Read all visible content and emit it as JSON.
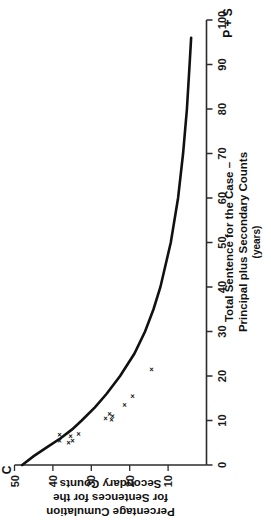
{
  "figure": {
    "corner_label": "C",
    "top_right_label": "P + S"
  },
  "chart_data": {
    "type": "scatter",
    "title": "",
    "subtitle": "",
    "xlabel": "Total Sentence for the Case – Principal plus Secondary Counts",
    "xlabel_line1": "Total Sentence for the Case –",
    "xlabel_line2": "Principal plus Secondary Counts",
    "xlabel_units": "(years)",
    "ylabel": "Percentage Cumulation for Sentences for the Secondary Counts",
    "ylabel_line1": "Percentage Cumulation",
    "ylabel_line2": "for Sentences for the",
    "ylabel_line3": "Secondary Counts",
    "x_axis_symbol": "P + S",
    "y_axis_symbol": "C",
    "xlim": [
      0,
      100
    ],
    "ylim": [
      0,
      50
    ],
    "xticks": [
      0,
      10,
      20,
      30,
      40,
      50,
      60,
      70,
      80,
      90,
      100
    ],
    "xticklabels": [
      "0",
      "10",
      "20",
      "30",
      "40",
      "50",
      "60",
      "70",
      "80",
      "90",
      "100"
    ],
    "yticks": [
      10,
      20,
      30,
      40,
      50
    ],
    "yticklabels": [
      "10",
      "20",
      "30",
      "40",
      "50"
    ],
    "grid": false,
    "legend": "none",
    "marker_glyph": "×",
    "series": [
      {
        "name": "Observed cases",
        "type": "scatter",
        "x": [
          5.0,
          5.5,
          5.5,
          6.5,
          6.8,
          7.0,
          10.2,
          10.5,
          11.0,
          11.5,
          13.5,
          15.5,
          21.5
        ],
        "y": [
          36.0,
          38.5,
          35.0,
          35.5,
          38.5,
          33.5,
          25.0,
          26.5,
          24.5,
          25.5,
          21.5,
          19.5,
          14.5
        ]
      },
      {
        "name": "Fitted curve",
        "type": "line",
        "x": [
          0.0,
          2.0,
          4.0,
          6.0,
          8.0,
          10.0,
          13.0,
          16.0,
          20.0,
          25.0,
          30.0,
          35.0,
          40.0,
          50.0,
          60.0,
          70.0,
          80.0,
          90.0,
          96.0
        ],
        "y": [
          48.0,
          45.0,
          41.5,
          38.0,
          35.0,
          32.5,
          29.0,
          26.0,
          22.5,
          18.8,
          16.0,
          13.8,
          12.0,
          9.3,
          7.4,
          6.1,
          5.1,
          4.4,
          4.0
        ]
      }
    ]
  }
}
